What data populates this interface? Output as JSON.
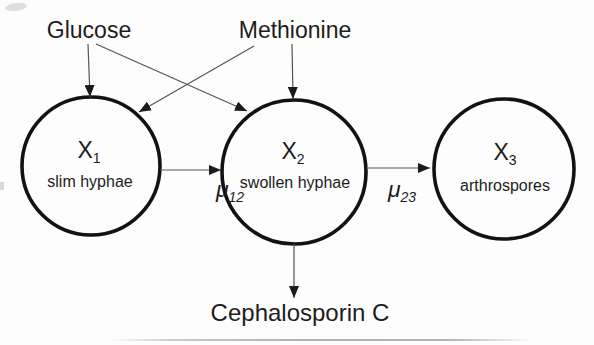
{
  "figure": {
    "inputs": [
      {
        "label": "Glucose"
      },
      {
        "label": "Methionine"
      }
    ],
    "nodes": [
      {
        "symbol": "X",
        "subscript": "1",
        "description": "slim hyphae"
      },
      {
        "symbol": "X",
        "subscript": "2",
        "description": "swollen hyphae"
      },
      {
        "symbol": "X",
        "subscript": "3",
        "description": "arthrospores"
      }
    ],
    "transitions": [
      {
        "symbol": "μ",
        "subscript": "12"
      },
      {
        "symbol": "μ",
        "subscript": "23"
      }
    ],
    "product": {
      "label": "Cephalosporin C"
    }
  },
  "colors": {
    "background": "#fdfdfd",
    "outline": "#121212",
    "connector": "#555555",
    "arrowhead": "#1a1a1a",
    "text": "#1c1c1c"
  }
}
